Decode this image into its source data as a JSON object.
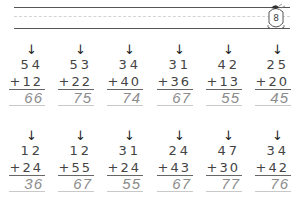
{
  "page": {
    "page_number": "8",
    "header_lines": [
      "solid",
      "dashed",
      "solid"
    ]
  },
  "rows": [
    {
      "problems": [
        {
          "top": "54",
          "addend": "+12",
          "answer": "66"
        },
        {
          "top": "53",
          "addend": "+22",
          "answer": "75"
        },
        {
          "top": "34",
          "addend": "+40",
          "answer": "74"
        },
        {
          "top": "31",
          "addend": "+36",
          "answer": "67"
        },
        {
          "top": "42",
          "addend": "+13",
          "answer": "55"
        },
        {
          "top": "25",
          "addend": "+20",
          "answer": "45"
        }
      ]
    },
    {
      "problems": [
        {
          "top": "12",
          "addend": "+24",
          "answer": "36"
        },
        {
          "top": "12",
          "addend": "+55",
          "answer": "67"
        },
        {
          "top": "31",
          "addend": "+24",
          "answer": "55"
        },
        {
          "top": "24",
          "addend": "+43",
          "answer": "67"
        },
        {
          "top": "47",
          "addend": "+30",
          "answer": "77"
        },
        {
          "top": "34",
          "addend": "+42",
          "answer": "76"
        }
      ]
    }
  ],
  "icons": {
    "arrow": "↓"
  }
}
